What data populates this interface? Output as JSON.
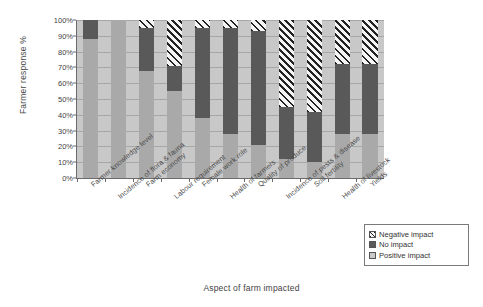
{
  "chart_data": {
    "type": "bar",
    "subtype": "stacked-100-percent",
    "title": "",
    "xlabel": "Aspect of farm impacted",
    "ylabel": "Farmer response %",
    "ylim": [
      0,
      100
    ],
    "yticks": [
      "0%",
      "10%",
      "20%",
      "30%",
      "40%",
      "50%",
      "60%",
      "70%",
      "80%",
      "90%",
      "100%"
    ],
    "ytick_values": [
      0,
      10,
      20,
      30,
      40,
      50,
      60,
      70,
      80,
      90,
      100
    ],
    "grid": true,
    "legend_position": "bottom-right",
    "categories": [
      "Farmer knowledge level",
      "Incidence of flora & fauna",
      "Farm economy",
      "Labour requirement",
      "Female work role",
      "Health of farmers",
      "Quality of produce",
      "Incidence of pests & disease",
      "Soil fertility",
      "Health of livestock",
      "Yields"
    ],
    "series": [
      {
        "name": "Negative impact",
        "color": "#222222",
        "pattern": "diagonal-hatch",
        "values": [
          0,
          0,
          5,
          29,
          5,
          5,
          7,
          55,
          58,
          28,
          28
        ]
      },
      {
        "name": "No impact",
        "color": "#595959",
        "pattern": "solid",
        "values": [
          12,
          0,
          27,
          16,
          57,
          67,
          72,
          33,
          32,
          44,
          44
        ]
      },
      {
        "name": "Positive impact",
        "color": "#a9a9a9",
        "pattern": "solid",
        "values": [
          88,
          100,
          68,
          55,
          38,
          28,
          21,
          12,
          10,
          28,
          28
        ]
      }
    ]
  },
  "legend": {
    "items": [
      {
        "label": "Negative impact",
        "swatch": "negative-impact-swatch"
      },
      {
        "label": "No impact",
        "swatch": "no-impact-swatch"
      },
      {
        "label": "Positive impact",
        "swatch": "positive-impact-swatch"
      }
    ]
  }
}
